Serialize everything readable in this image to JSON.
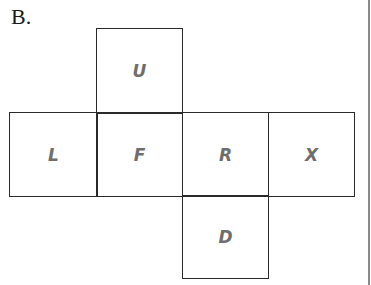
{
  "option_label": "B.",
  "net": {
    "faces": [
      {
        "id": "U",
        "label": "U",
        "x": 96,
        "y": 28,
        "w": 87,
        "h": 86
      },
      {
        "id": "L",
        "label": "L",
        "x": 9,
        "y": 112,
        "w": 89,
        "h": 85
      },
      {
        "id": "F",
        "label": "F",
        "x": 96,
        "y": 112,
        "w": 87,
        "h": 85
      },
      {
        "id": "R",
        "label": "R",
        "x": 182,
        "y": 112,
        "w": 87,
        "h": 85
      },
      {
        "id": "X",
        "label": "X",
        "x": 268,
        "y": 112,
        "w": 87,
        "h": 85
      },
      {
        "id": "D",
        "label": "D",
        "x": 182,
        "y": 195,
        "w": 87,
        "h": 84
      }
    ]
  },
  "colors": {
    "line": "#2a2a2a",
    "letter": "#6e6e6e",
    "rule": "#8a8a8a"
  }
}
